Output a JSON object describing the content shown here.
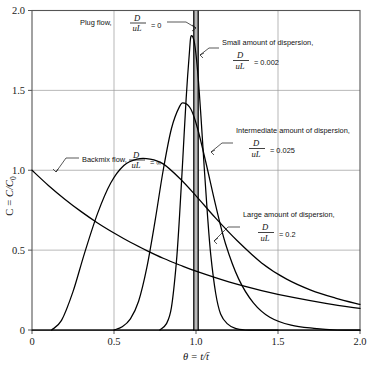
{
  "chart_data": {
    "type": "line",
    "title": "",
    "xlabel": "θ = t/t̄",
    "ylabel": "C = C/C₀",
    "xlim": [
      0,
      2.0
    ],
    "ylim": [
      0,
      2.0
    ],
    "xticks": [
      "0",
      "0.5",
      "1.0",
      "1.5",
      "2.0"
    ],
    "xtick_values": [
      0,
      0.5,
      1.0,
      1.5,
      2.0
    ],
    "yticks": [
      "0",
      "0.5",
      "1.0",
      "1.5",
      "2.0"
    ],
    "ytick_values": [
      0,
      0.5,
      1.0,
      1.5,
      2.0
    ],
    "grid": true,
    "grid_note": "light gray gridlines at x=0.5,1.0,1.5 and y=0.5,1.0,1.5",
    "legend_position": "inline annotations with leader lines",
    "series": [
      {
        "name": "Plug flow",
        "param_label": "D/uL",
        "param_value": "0",
        "description": "ideal impulse spike at theta = 1.0, drawn as a narrow vertical line spanning full height",
        "x": [
          1.0,
          1.0
        ],
        "y": [
          0,
          2.0
        ]
      },
      {
        "name": "Small amount of dispersion",
        "param_label": "D/uL",
        "param_value": "0.002",
        "peak_x": 0.97,
        "peak_y": 1.84,
        "x": [
          0.78,
          0.82,
          0.85,
          0.88,
          0.9,
          0.92,
          0.94,
          0.96,
          0.97,
          0.99,
          1.01,
          1.03,
          1.05,
          1.07,
          1.09,
          1.12,
          1.15,
          1.19,
          1.24,
          1.3,
          1.38,
          1.5
        ],
        "y": [
          0.0,
          0.04,
          0.14,
          0.42,
          0.72,
          1.08,
          1.45,
          1.74,
          1.84,
          1.8,
          1.62,
          1.34,
          1.02,
          0.72,
          0.47,
          0.23,
          0.1,
          0.04,
          0.01,
          0.0,
          0.0,
          0.0
        ]
      },
      {
        "name": "Intermediate amount of dispersion",
        "param_label": "D/uL",
        "param_value": "0.025",
        "peak_x": 0.93,
        "peak_y": 1.42,
        "x": [
          0.5,
          0.55,
          0.6,
          0.65,
          0.7,
          0.75,
          0.8,
          0.85,
          0.9,
          0.93,
          0.97,
          1.01,
          1.06,
          1.12,
          1.18,
          1.26,
          1.35,
          1.45,
          1.58,
          1.72,
          1.86,
          2.0
        ],
        "y": [
          0.0,
          0.02,
          0.07,
          0.18,
          0.39,
          0.68,
          1.0,
          1.26,
          1.4,
          1.42,
          1.38,
          1.26,
          1.05,
          0.78,
          0.54,
          0.32,
          0.17,
          0.08,
          0.03,
          0.01,
          0.0,
          0.0
        ]
      },
      {
        "name": "Large amount of dispersion",
        "param_label": "D/uL",
        "param_value": "0.2",
        "peak_x": 0.72,
        "peak_y": 1.07,
        "x": [
          0.12,
          0.18,
          0.25,
          0.32,
          0.4,
          0.48,
          0.56,
          0.64,
          0.72,
          0.8,
          0.9,
          1.0,
          1.12,
          1.25,
          1.4,
          1.55,
          1.7,
          1.85,
          2.0
        ],
        "y": [
          0.0,
          0.06,
          0.24,
          0.48,
          0.73,
          0.92,
          1.03,
          1.07,
          1.07,
          1.04,
          0.95,
          0.84,
          0.7,
          0.56,
          0.42,
          0.32,
          0.25,
          0.2,
          0.16
        ]
      },
      {
        "name": "Backmix flow",
        "param_label": "D/uL",
        "param_value": "∞",
        "description": "exponential decay C = exp(-theta) starting at 1.0",
        "x": [
          0,
          0.1,
          0.2,
          0.3,
          0.4,
          0.5,
          0.6,
          0.7,
          0.8,
          0.9,
          1.0,
          1.2,
          1.4,
          1.6,
          1.8,
          2.0
        ],
        "y": [
          1.0,
          0.905,
          0.819,
          0.741,
          0.67,
          0.607,
          0.549,
          0.497,
          0.449,
          0.407,
          0.368,
          0.301,
          0.247,
          0.202,
          0.165,
          0.135
        ]
      }
    ],
    "annotations": [
      {
        "id": "plug-flow",
        "text": "Plug flow,",
        "numerator": "D",
        "denominator": "uL",
        "equals": "= 0"
      },
      {
        "id": "small-dispersion",
        "text": "Small amount of dispersion,",
        "numerator": "D",
        "denominator": "uL",
        "equals": "= 0.002"
      },
      {
        "id": "intermediate-dispersion",
        "text": "Intermediate amount of dispersion,",
        "numerator": "D",
        "denominator": "uL",
        "equals": "= 0.025"
      },
      {
        "id": "large-dispersion",
        "text": "Large amount of dispersion,",
        "numerator": "D",
        "denominator": "uL",
        "equals": "= 0.2"
      },
      {
        "id": "backmix-flow",
        "text": "Backmix flow,",
        "numerator": "D",
        "denominator": "uL",
        "equals": "= ∞"
      }
    ],
    "colors": {
      "curve": "#000000",
      "grid": "#9a9a9a",
      "frame": "#555555",
      "text": "#111111",
      "background": "#ffffff"
    }
  },
  "axis": {
    "y_title_parts": {
      "c": "C",
      "eq": "=",
      "frac": "C/C",
      "sub": "0"
    },
    "x_title_parts": {
      "theta": "θ",
      "eq": "=",
      "frac": "t/t̄"
    }
  }
}
